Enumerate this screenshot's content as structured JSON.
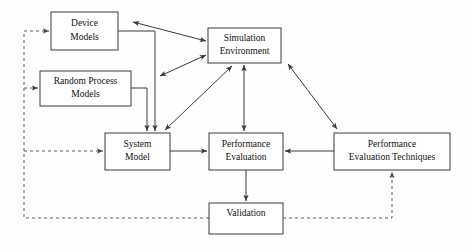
{
  "diagram": {
    "type": "block-flow-diagram",
    "canvas": {
      "width": 468,
      "height": 250,
      "background": "#fefefe"
    },
    "colors": {
      "box_stroke": "#3a3a3a",
      "box_fill": "#ffffff",
      "solid_edge": "#3a3a3a",
      "dashed_edge": "#5a5a5a",
      "text": "#101010"
    },
    "nodes": [
      {
        "id": "device-models",
        "label_lines": [
          "Device",
          "Models"
        ],
        "x": 51,
        "y": 12,
        "w": 67,
        "h": 38
      },
      {
        "id": "random-process-models",
        "label_lines": [
          "Random Process",
          "Models"
        ],
        "x": 40,
        "y": 71,
        "w": 91,
        "h": 35
      },
      {
        "id": "simulation-environment",
        "label_lines": [
          "Simulation",
          "Environment"
        ],
        "x": 208,
        "y": 28,
        "w": 73,
        "h": 35
      },
      {
        "id": "system-model",
        "label_lines": [
          "System",
          "Model"
        ],
        "x": 105,
        "y": 133,
        "w": 65,
        "h": 37
      },
      {
        "id": "performance-evaluation",
        "label_lines": [
          "Performance",
          "Evaluation"
        ],
        "x": 209,
        "y": 133,
        "w": 74,
        "h": 37
      },
      {
        "id": "performance-evaluation-techniques",
        "label_lines": [
          "Performance",
          "Evaluation Techniques"
        ],
        "x": 334,
        "y": 133,
        "w": 116,
        "h": 37
      },
      {
        "id": "validation",
        "label_lines": [
          "Validation"
        ],
        "x": 209,
        "y": 203,
        "w": 74,
        "h": 31
      }
    ],
    "edges": [
      {
        "id": "device-to-sim",
        "from": "device-models",
        "to": "simulation-environment",
        "style": "solid",
        "arrows": "double"
      },
      {
        "id": "sim-to-systemfeed",
        "from": "simulation-environment",
        "to": "system-model",
        "style": "solid",
        "arrows": "double"
      },
      {
        "id": "device-to-system",
        "from": "device-models",
        "to": "system-model",
        "style": "solid",
        "arrows": "single"
      },
      {
        "id": "random-to-system",
        "from": "random-process-models",
        "to": "system-model",
        "style": "solid",
        "arrows": "single"
      },
      {
        "id": "system-to-perfeval",
        "from": "system-model",
        "to": "performance-evaluation",
        "style": "solid",
        "arrows": "single"
      },
      {
        "id": "sim-to-perfeval",
        "from": "simulation-environment",
        "to": "performance-evaluation",
        "style": "solid",
        "arrows": "double"
      },
      {
        "id": "sim-to-techniques",
        "from": "simulation-environment",
        "to": "performance-evaluation-techniques",
        "style": "solid",
        "arrows": "double"
      },
      {
        "id": "techniques-to-perfeval",
        "from": "performance-evaluation-techniques",
        "to": "performance-evaluation",
        "style": "solid",
        "arrows": "single"
      },
      {
        "id": "perfeval-to-validation",
        "from": "performance-evaluation",
        "to": "validation",
        "style": "solid",
        "arrows": "single"
      },
      {
        "id": "validation-to-techniques",
        "from": "validation",
        "to": "performance-evaluation-techniques",
        "style": "dashed",
        "arrows": "single"
      },
      {
        "id": "validation-feedback-bus",
        "from": "validation",
        "to": "device-models",
        "style": "dashed",
        "arrows": "single"
      },
      {
        "id": "feedback-to-random",
        "from": "validation",
        "to": "random-process-models",
        "style": "dashed",
        "arrows": "single"
      },
      {
        "id": "feedback-to-system",
        "from": "validation",
        "to": "system-model",
        "style": "dashed",
        "arrows": "single"
      }
    ]
  }
}
